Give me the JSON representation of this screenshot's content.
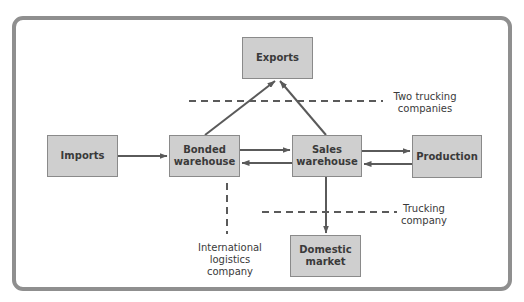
{
  "diagram": {
    "nodes": {
      "exports": "Exports",
      "imports": "Imports",
      "bonded": "Bonded\nwarehouse",
      "sales": "Sales\nwarehouse",
      "production": "Production",
      "domestic": "Domestic\nmarket"
    },
    "annotations": {
      "two_trucking": "Two trucking\ncompanies",
      "trucking": "Trucking\ncompany",
      "international": "International\nlogistics\ncompany"
    },
    "edges": [
      {
        "from": "imports",
        "to": "bonded"
      },
      {
        "from": "bonded",
        "to": "sales"
      },
      {
        "from": "sales",
        "to": "bonded"
      },
      {
        "from": "sales",
        "to": "production"
      },
      {
        "from": "production",
        "to": "sales"
      },
      {
        "from": "bonded",
        "to": "exports"
      },
      {
        "from": "sales",
        "to": "exports"
      },
      {
        "from": "sales",
        "to": "domestic"
      }
    ],
    "colors": {
      "box_fill": "#cfcfcf",
      "box_border": "#8a8a8a",
      "arrow": "#5a5a5a",
      "frame": "#8f8f8f"
    }
  }
}
